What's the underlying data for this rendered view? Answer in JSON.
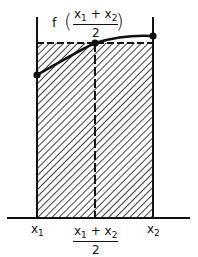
{
  "diagram": {
    "title_label": {
      "func": "f",
      "open_paren": "(",
      "close_paren": ")",
      "numerator": {
        "a": "x",
        "a_sub": "1",
        "op": "+",
        "b": "x",
        "b_sub": "2"
      },
      "denominator": "2"
    },
    "axis_labels": {
      "x1": {
        "base": "x",
        "sub": "1"
      },
      "x2": {
        "base": "x",
        "sub": "2"
      },
      "midpoint": {
        "numerator": {
          "a": "x",
          "a_sub": "1",
          "op": "+",
          "b": "x",
          "b_sub": "2"
        },
        "denominator": "2"
      }
    },
    "points": [
      {
        "name": "f(x1)",
        "x": 37,
        "y": 75
      },
      {
        "name": "f((x1+x2)/2)",
        "x": 95,
        "y": 43
      },
      {
        "name": "f(x2)",
        "x": 153,
        "y": 36
      }
    ]
  }
}
